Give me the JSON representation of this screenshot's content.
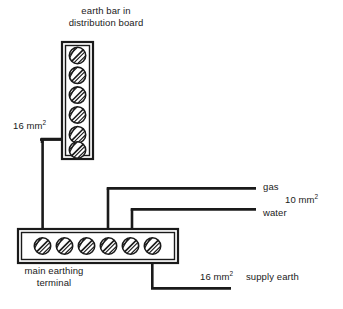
{
  "diagram": {
    "canvas": {
      "width": 343,
      "height": 309,
      "background": "#ffffff"
    },
    "stroke_color": "#1a1a1a",
    "text_color": "#1a1a1a"
  },
  "earth_bar": {
    "name": "earth bar in distribution board",
    "label_line1": "earth bar in",
    "label_line2": "distribution board",
    "orientation": "vertical",
    "terminal_count": 6,
    "x": 62,
    "y": 42,
    "width": 31,
    "height": 117
  },
  "main_terminal": {
    "name": "main earthing terminal",
    "label_line1": "main earthing",
    "label_line2": "terminal",
    "orientation": "horizontal",
    "terminal_count": 6,
    "x": 18,
    "y": 229,
    "width": 160,
    "height": 34
  },
  "conductors": [
    {
      "id": "bar-to-met",
      "label": "16 mm",
      "superscript": "2",
      "from": "earth bar",
      "to": "main earthing terminal"
    },
    {
      "id": "gas-bond",
      "label": "gas",
      "from": "main earthing terminal",
      "to": "gas service"
    },
    {
      "id": "water-bond",
      "label": "water",
      "from": "main earthing terminal",
      "to": "water service"
    },
    {
      "id": "bonding-size",
      "label": "10 mm",
      "superscript": "2",
      "applies_to": "gas and water bonding conductors"
    },
    {
      "id": "supply-earth",
      "label": "16 mm",
      "superscript": "2",
      "name_label": "supply earth",
      "from": "main earthing terminal",
      "to": "supply earth"
    }
  ],
  "labels": {
    "sixteen_mm_bar": {
      "value": "16 mm",
      "sup": "2"
    },
    "gas": "gas",
    "ten_mm": {
      "value": "10 mm",
      "sup": "2"
    },
    "water": "water",
    "sixteen_mm_supply": {
      "value": "16 mm",
      "sup": "2"
    },
    "supply_earth": "supply earth",
    "title_line1": "earth bar in",
    "title_line2": "distribution board",
    "met_line1": "main earthing",
    "met_line2": "terminal"
  }
}
